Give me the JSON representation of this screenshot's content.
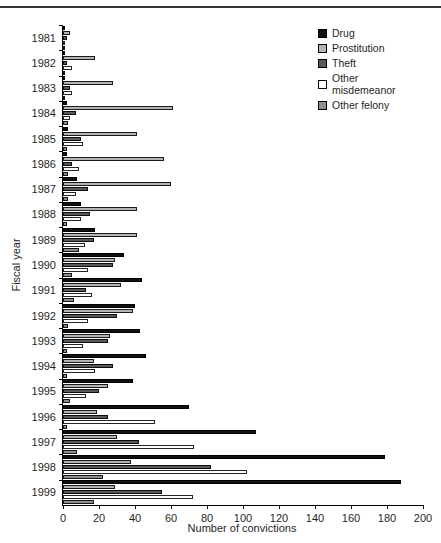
{
  "chart_data": {
    "type": "bar",
    "orientation": "horizontal",
    "title": "",
    "xlabel": "Number of convictions",
    "ylabel": "Fiscal year",
    "xlim": [
      0,
      200
    ],
    "xticks": [
      0,
      20,
      40,
      60,
      80,
      100,
      120,
      140,
      160,
      180,
      200
    ],
    "grid": false,
    "legend_position": "top-right",
    "categories": [
      "1981",
      "1982",
      "1983",
      "1984",
      "1985",
      "1986",
      "1987",
      "1988",
      "1989",
      "1990",
      "1991",
      "1992",
      "1993",
      "1994",
      "1995",
      "1996",
      "1997",
      "1998",
      "1999"
    ],
    "series": [
      {
        "name": "Drug",
        "color": "#111111",
        "values": [
          1,
          1,
          1,
          2,
          3,
          2,
          8,
          10,
          18,
          34,
          44,
          40,
          43,
          46,
          39,
          70,
          107,
          179,
          188
        ]
      },
      {
        "name": "Prostitution",
        "color": "#b4b4b4",
        "values": [
          4,
          18,
          28,
          61,
          41,
          56,
          60,
          41,
          41,
          29,
          32,
          39,
          26,
          17,
          25,
          19,
          30,
          38,
          29
        ]
      },
      {
        "name": "Theft",
        "color": "#5a5a5a",
        "values": [
          2,
          2,
          4,
          7,
          10,
          5,
          14,
          15,
          17,
          28,
          13,
          30,
          25,
          28,
          20,
          25,
          42,
          82,
          55
        ]
      },
      {
        "name": "Other misdemeanor",
        "color": "#ffffff",
        "values": [
          1,
          5,
          5,
          4,
          11,
          9,
          7,
          10,
          12,
          14,
          16,
          14,
          11,
          18,
          13,
          51,
          73,
          102,
          72
        ]
      },
      {
        "name": "Other felony",
        "color": "#8e8e8e",
        "values": [
          1,
          1,
          1,
          3,
          2,
          3,
          3,
          2,
          9,
          5,
          6,
          3,
          2,
          2,
          4,
          2,
          8,
          22,
          17
        ]
      }
    ]
  }
}
